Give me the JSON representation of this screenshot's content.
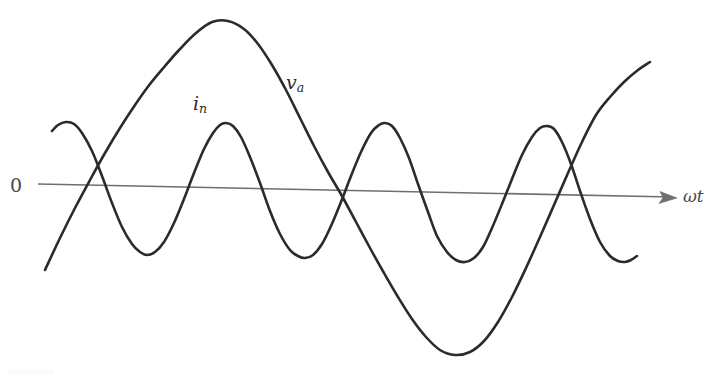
{
  "figure": {
    "background_color": "#ffffff",
    "width": 713,
    "height": 379
  },
  "axis": {
    "zero_label": "0",
    "x_axis_label": "ωt",
    "axis_color": "#6f6f6f",
    "axis_start": {
      "x": 38,
      "y": 184
    },
    "axis_end": {
      "x": 677,
      "y": 198
    },
    "arrowhead": "right-arrow"
  },
  "curves": [
    {
      "id": "v_a",
      "label": "v",
      "label_sub": "a",
      "label_position": {
        "x": 286,
        "y": 73
      },
      "color": "#2b2b2b",
      "stroke_width": 2.6,
      "description": "Large-amplitude low-frequency quasi-sinusoidal output voltage waveform"
    },
    {
      "id": "i_n",
      "label": "i",
      "label_sub": "n",
      "label_position": {
        "x": 193,
        "y": 94
      },
      "color": "#2b2b2b",
      "stroke_width": 2.6,
      "description": "Smaller-amplitude higher-frequency neutral current waveform"
    }
  ],
  "chart_data": {
    "type": "line",
    "title": "",
    "xlabel": "ωt",
    "ylabel": "",
    "grid": false,
    "legend": "inline-curve-labels",
    "zero_line": true,
    "xlim": [
      0,
      713
    ],
    "ylim": [
      379,
      0
    ],
    "annotations": [
      {
        "text": "0",
        "x": 14,
        "y": 185
      },
      {
        "text": "ωt",
        "x": 690,
        "y": 197
      },
      {
        "text": "v_a",
        "x": 292,
        "y": 82
      },
      {
        "text": "i_n",
        "x": 199,
        "y": 103
      }
    ],
    "series": [
      {
        "name": "v_a",
        "color": "#2b2b2b",
        "points": [
          [
            45,
            270
          ],
          [
            60,
            238
          ],
          [
            75,
            208
          ],
          [
            90,
            180
          ],
          [
            105,
            153
          ],
          [
            120,
            128
          ],
          [
            135,
            105
          ],
          [
            150,
            84
          ],
          [
            165,
            66
          ],
          [
            180,
            49
          ],
          [
            196,
            33
          ],
          [
            212,
            22
          ],
          [
            228,
            21
          ],
          [
            244,
            29
          ],
          [
            258,
            44
          ],
          [
            272,
            65
          ],
          [
            286,
            90
          ],
          [
            300,
            118
          ],
          [
            314,
            146
          ],
          [
            328,
            172
          ],
          [
            342,
            196
          ],
          [
            356,
            222
          ],
          [
            370,
            248
          ],
          [
            384,
            273
          ],
          [
            398,
            297
          ],
          [
            412,
            319
          ],
          [
            426,
            337
          ],
          [
            440,
            350
          ],
          [
            455,
            355
          ],
          [
            470,
            352
          ],
          [
            484,
            341
          ],
          [
            498,
            322
          ],
          [
            512,
            297
          ],
          [
            526,
            268
          ],
          [
            540,
            237
          ],
          [
            554,
            205
          ],
          [
            568,
            173
          ],
          [
            582,
            142
          ],
          [
            596,
            115
          ],
          [
            610,
            97
          ],
          [
            624,
            82
          ],
          [
            638,
            70
          ],
          [
            650,
            62
          ]
        ]
      },
      {
        "name": "i_n",
        "color": "#2b2b2b",
        "points": [
          [
            52,
            131
          ],
          [
            58,
            125
          ],
          [
            66,
            122
          ],
          [
            74,
            124
          ],
          [
            82,
            133
          ],
          [
            92,
            151
          ],
          [
            102,
            176
          ],
          [
            112,
            203
          ],
          [
            122,
            227
          ],
          [
            132,
            244
          ],
          [
            140,
            252
          ],
          [
            147,
            255
          ],
          [
            155,
            252
          ],
          [
            164,
            242
          ],
          [
            174,
            223
          ],
          [
            184,
            199
          ],
          [
            194,
            173
          ],
          [
            204,
            149
          ],
          [
            213,
            133
          ],
          [
            220,
            125
          ],
          [
            226,
            123
          ],
          [
            233,
            126
          ],
          [
            241,
            137
          ],
          [
            250,
            157
          ],
          [
            260,
            183
          ],
          [
            270,
            211
          ],
          [
            280,
            234
          ],
          [
            290,
            250
          ],
          [
            298,
            256
          ],
          [
            305,
            258
          ],
          [
            313,
            255
          ],
          [
            322,
            244
          ],
          [
            331,
            226
          ],
          [
            341,
            202
          ],
          [
            351,
            176
          ],
          [
            361,
            152
          ],
          [
            371,
            133
          ],
          [
            379,
            125
          ],
          [
            385,
            123
          ],
          [
            392,
            126
          ],
          [
            400,
            138
          ],
          [
            409,
            158
          ],
          [
            418,
            184
          ],
          [
            428,
            212
          ],
          [
            437,
            236
          ],
          [
            447,
            252
          ],
          [
            456,
            260
          ],
          [
            465,
            262
          ],
          [
            474,
            258
          ],
          [
            483,
            247
          ],
          [
            492,
            228
          ],
          [
            502,
            204
          ],
          [
            512,
            179
          ],
          [
            522,
            155
          ],
          [
            532,
            137
          ],
          [
            540,
            128
          ],
          [
            547,
            126
          ],
          [
            554,
            129
          ],
          [
            562,
            142
          ],
          [
            571,
            164
          ],
          [
            580,
            191
          ],
          [
            590,
            219
          ],
          [
            600,
            242
          ],
          [
            610,
            256
          ],
          [
            618,
            261
          ],
          [
            625,
            262
          ],
          [
            631,
            260
          ],
          [
            637,
            256
          ]
        ]
      }
    ]
  }
}
